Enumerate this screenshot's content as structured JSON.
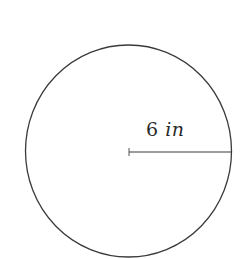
{
  "diagram": {
    "shape": "circle",
    "radius_label": {
      "value": "6",
      "unit": "in"
    },
    "colors": {
      "stroke": "#3a3a3a",
      "background": "#ffffff"
    }
  }
}
